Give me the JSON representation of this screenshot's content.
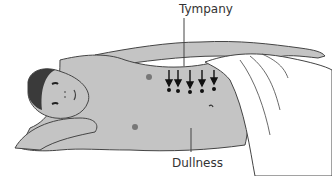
{
  "figure": {
    "labels": {
      "tympany": "Tympany",
      "dullness": "Dullness"
    },
    "arrows": {
      "count": 5,
      "direction": "down"
    },
    "colors": {
      "skin": "#c4c4c4",
      "outline": "#444444",
      "sheet": "#ffffff",
      "hair": "#3a3a3a",
      "text": "#333333"
    }
  }
}
